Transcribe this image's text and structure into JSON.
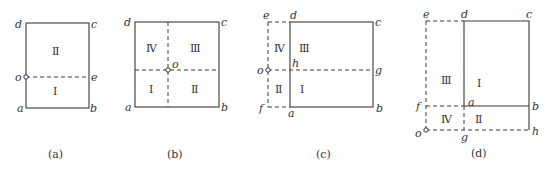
{
  "figure": {
    "panels": [
      {
        "caption": "(a)",
        "points": {
          "a": "a",
          "b": "b",
          "c": "c",
          "d": "d",
          "e": "e",
          "o": "o"
        },
        "regions": [
          "Ⅰ",
          "Ⅱ"
        ]
      },
      {
        "caption": "(b)",
        "points": {
          "a": "a",
          "b": "b",
          "c": "c",
          "d": "d",
          "o": "o"
        },
        "regions": [
          "Ⅰ",
          "Ⅱ",
          "Ⅲ",
          "Ⅳ"
        ]
      },
      {
        "caption": "(c)",
        "points": {
          "a": "a",
          "b": "b",
          "c": "c",
          "d": "d",
          "e": "e",
          "f": "f",
          "g": "g",
          "h": "h",
          "o": "o"
        },
        "regions": [
          "Ⅰ",
          "Ⅱ",
          "Ⅲ",
          "Ⅳ"
        ]
      },
      {
        "caption": "(d)",
        "points": {
          "a": "a",
          "b": "b",
          "c": "c",
          "d": "d",
          "e": "e",
          "f": "f",
          "g": "g",
          "h": "h",
          "o": "o"
        },
        "regions": [
          "Ⅰ",
          "Ⅱ",
          "Ⅲ",
          "Ⅳ"
        ]
      }
    ]
  }
}
